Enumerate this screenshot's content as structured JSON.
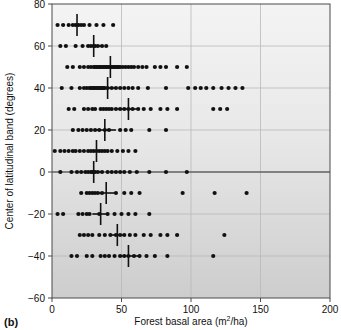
{
  "figure": {
    "panel_label": "(b)",
    "background_top_color": "#f2f2f2",
    "background_bottom_color": "#cfcfcf",
    "point_color": "#111111",
    "grid_color": "#b9b9b9",
    "axis_color": "#4a4a4a"
  },
  "axes": {
    "x_title": "Forest basal area (m",
    "x_title_sup": "2",
    "x_title_tail": "/ha)",
    "y_title": "Center of latitudinal band (degrees)",
    "x_ticks": [
      0,
      50,
      100,
      150,
      200
    ],
    "y_ticks": [
      -60,
      -40,
      -20,
      0,
      20,
      40,
      60,
      80
    ]
  },
  "chart_data": {
    "type": "scatter",
    "title": "",
    "xlabel": "Forest basal area (m2/ha)",
    "ylabel": "Center of latitudinal band (degrees)",
    "xlim": [
      0,
      200
    ],
    "ylim": [
      -60,
      80
    ],
    "grid": true,
    "legend": "none",
    "x_ticks": [
      0,
      50,
      100,
      150,
      200
    ],
    "y_ticks": [
      -60,
      -40,
      -20,
      0,
      20,
      40,
      60,
      80
    ],
    "zero_reference_line_y": 0,
    "series": [
      {
        "name": "Forest basal area by latitudinal band",
        "bands": [
          {
            "y": 70,
            "mean": 18,
            "mean_bar_low": 14,
            "mean_bar_high": 22,
            "x": [
              4,
              8,
              12,
              15,
              17,
              19,
              21,
              23,
              27,
              32,
              37,
              44
            ]
          },
          {
            "y": 60,
            "mean": 30,
            "mean_bar_low": 25,
            "mean_bar_high": 35,
            "x": [
              6,
              10,
              17,
              22,
              26,
              28,
              30,
              31,
              33,
              36,
              39
            ]
          },
          {
            "y": 50,
            "mean": 42,
            "mean_bar_low": 36,
            "mean_bar_high": 48,
            "x": [
              11,
              15,
              20,
              23,
              26,
              28,
              30,
              31,
              32,
              33,
              34,
              35,
              36,
              37,
              38,
              39,
              40,
              41,
              42,
              43,
              44,
              45,
              46,
              47,
              48,
              49,
              51,
              53,
              55,
              57,
              59,
              62,
              65,
              68,
              74,
              78,
              82,
              90,
              97
            ]
          },
          {
            "y": 40,
            "mean": 40,
            "mean_bar_low": 33,
            "mean_bar_high": 47,
            "x": [
              7,
              14,
              20,
              23,
              25,
              27,
              28,
              29,
              30,
              31,
              32,
              33,
              34,
              35,
              36,
              37,
              38,
              40,
              43,
              46,
              49,
              52,
              55,
              58,
              62,
              69,
              82,
              98,
              103,
              107,
              111,
              116,
              122,
              127,
              132,
              137
            ]
          },
          {
            "y": 30,
            "mean": 55,
            "mean_bar_low": 47,
            "mean_bar_high": 62,
            "x": [
              12,
              16,
              23,
              26,
              29,
              31,
              35,
              37,
              39,
              41,
              43,
              46,
              49,
              52,
              55,
              58,
              62,
              66,
              71,
              78,
              83,
              90,
              116,
              121,
              126
            ]
          },
          {
            "y": 20,
            "mean": 38,
            "mean_bar_low": 30,
            "mean_bar_high": 46,
            "x": [
              15,
              19,
              22,
              25,
              28,
              31,
              34,
              38,
              41,
              49,
              53,
              57,
              70,
              82
            ]
          },
          {
            "y": 10,
            "mean": 32,
            "mean_bar_low": 27,
            "mean_bar_high": 37,
            "x": [
              2,
              6,
              9,
              12,
              15,
              17,
              20,
              23,
              26,
              28,
              30,
              32,
              34,
              36,
              38,
              40,
              43,
              47,
              51,
              55,
              60
            ]
          },
          {
            "y": 0,
            "mean": 30,
            "mean_bar_low": 24,
            "mean_bar_high": 36,
            "x": [
              6,
              14,
              18,
              21,
              24,
              26,
              28,
              29,
              30,
              31,
              33,
              36,
              40,
              43,
              46,
              49,
              52,
              56,
              61,
              70,
              82,
              97
            ]
          },
          {
            "y": -10,
            "mean": 39,
            "mean_bar_low": 33,
            "mean_bar_high": 45,
            "x": [
              21,
              25,
              27,
              29,
              31,
              33,
              36,
              46,
              52,
              57,
              63,
              94,
              117,
              140
            ]
          },
          {
            "y": -20,
            "mean": 35,
            "mean_bar_low": 29,
            "mean_bar_high": 41,
            "x": [
              4,
              8,
              19,
              22,
              25,
              27,
              34,
              40,
              45,
              50,
              55,
              60,
              70
            ]
          },
          {
            "y": -30,
            "mean": 47,
            "mean_bar_low": 41,
            "mean_bar_high": 53,
            "x": [
              20,
              23,
              26,
              29,
              34,
              38,
              42,
              46,
              49,
              52,
              56,
              60,
              66,
              71,
              78,
              83,
              90,
              124
            ]
          },
          {
            "y": -40,
            "mean": 55,
            "mean_bar_low": 48,
            "mean_bar_high": 62,
            "x": [
              14,
              18,
              25,
              29,
              35,
              38,
              41,
              45,
              49,
              52,
              55,
              59,
              63,
              68,
              74,
              83,
              116
            ]
          }
        ]
      }
    ]
  }
}
